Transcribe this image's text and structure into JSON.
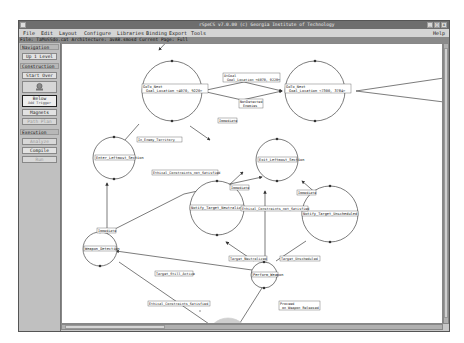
{
  "window": {
    "title": "rSpeCS v7.0.00 (c) Georgia Institute of Technology",
    "controls": [
      "_",
      "□",
      "x"
    ]
  },
  "menubar": {
    "items": [
      "File",
      "Edit",
      "Layout",
      "Configure",
      "Libraries",
      "Binding",
      "Export",
      "Tools"
    ],
    "help": "Help"
  },
  "statusbar": {
    "text": "File: TaMoSSdo.cat  Architecture: avAB.smosd  Current Page: Full"
  },
  "sidebar": {
    "navigation": {
      "header": "Navigation",
      "up_level": "Up 1 Level"
    },
    "construction": {
      "header": "Construction",
      "start_over": "Start Over",
      "icon_tool_label": "Sel Tool",
      "below_label": "Below",
      "below_sub": "Add Trigger",
      "magnets": "Magnets",
      "path_plan": "Path Plan"
    },
    "execution": {
      "header": "Execution",
      "analyze": "Analyze",
      "compile": "Compile",
      "run": "Run"
    }
  },
  "diagram": {
    "states": [
      {
        "id": "goto1",
        "label": "GoTo_Next",
        "sub": "Goal_Location <4070, 9220>"
      },
      {
        "id": "goto2",
        "label": "GoTo_Next",
        "sub": "Goal_Location <7300, 3784>"
      },
      {
        "id": "enter",
        "label": "Enter_Leftmost_Section"
      },
      {
        "id": "exit",
        "label": "Exit_Leftmost_Section"
      },
      {
        "id": "notify_neutral",
        "label": "Notify_Target_Neutralized"
      },
      {
        "id": "notify_unsched",
        "label": "Notify_Target_Unscheduled"
      },
      {
        "id": "weapon",
        "label": "Weapon_Detection"
      },
      {
        "id": "perform",
        "label": "Perform_Weapon"
      },
      {
        "id": "engage",
        "label": "Engage_Combatants",
        "highlight": true
      }
    ],
    "transitions": [
      {
        "label": "AtGoal",
        "sub": "Goal_Location <4070, 9220>"
      },
      {
        "label": "NotDetected",
        "sub": "Enemies"
      },
      {
        "label": "In_Enemy_Territory"
      },
      {
        "label": "Immediate"
      },
      {
        "label": "Ethical_Constraints_not_Satisfied"
      },
      {
        "label": "Immediate"
      },
      {
        "label": "Immediate"
      },
      {
        "label": "Immediate"
      },
      {
        "label": "Ethical_Constraints_not_Satisfied"
      },
      {
        "label": "Target_Neutralized"
      },
      {
        "label": "Target_Unscheduled"
      },
      {
        "label": "Target_Still_Active"
      },
      {
        "label": "Ethical_Constraints_Satisfied"
      },
      {
        "label": "Proceed",
        "sub": "on Weapon Released"
      }
    ]
  },
  "colors": {
    "titlebar": "#6e6e6e",
    "highlight_state": "#c8c8c8",
    "canvas": "#ffffff"
  }
}
